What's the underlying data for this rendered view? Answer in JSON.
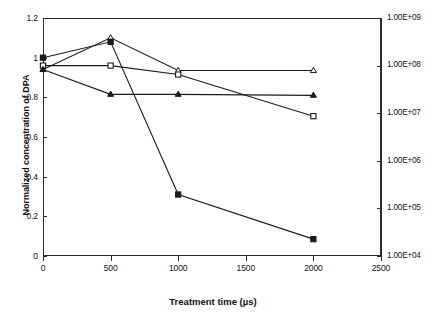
{
  "chart_data": {
    "type": "line",
    "title": "",
    "xlabel": "Treatment time (µs)",
    "ylabel": "Normalized concentration of DPA",
    "y2label": "cfu/mL",
    "xlim": [
      0,
      2500
    ],
    "ylim": [
      0,
      1.2
    ],
    "y2lim": [
      10000,
      1000000000
    ],
    "y2scale": "log",
    "grid": false,
    "legend": "none",
    "xticks": [
      "0",
      "500",
      "1000",
      "1500",
      "2000",
      "2500"
    ],
    "xtick_values": [
      0,
      500,
      1000,
      1500,
      2000,
      2500
    ],
    "yticks": [
      "0",
      "0.2",
      "0.4",
      "0.6",
      "0.8",
      "1",
      "1.2"
    ],
    "ytick_values": [
      0,
      0.2,
      0.4,
      0.6,
      0.8,
      1.0,
      1.2
    ],
    "y2ticks": [
      "1.00E+09",
      "1.00E+08",
      "1.00E+07",
      "1.00E+06",
      "1.00E+05",
      "1.00E+04"
    ],
    "y2tick_values": [
      1000000000,
      100000000,
      10000000,
      1000000,
      100000,
      10000
    ],
    "x": [
      0,
      500,
      1000,
      2000
    ],
    "series": [
      {
        "name": "open-triangle-series",
        "marker": "open-triangle",
        "axis": "left",
        "values": [
          0.94,
          1.1,
          0.935,
          0.935
        ]
      },
      {
        "name": "open-square-series",
        "marker": "open-square",
        "axis": "left",
        "values": [
          0.96,
          0.96,
          0.915,
          0.705
        ]
      },
      {
        "name": "filled-triangle-series",
        "marker": "filled-triangle",
        "axis": "left",
        "values": [
          0.94,
          0.815,
          0.815,
          0.81
        ]
      },
      {
        "name": "filled-square-series",
        "marker": "filled-square",
        "axis": "left",
        "values": [
          1.0,
          1.08,
          0.31,
          0.085
        ]
      }
    ]
  }
}
